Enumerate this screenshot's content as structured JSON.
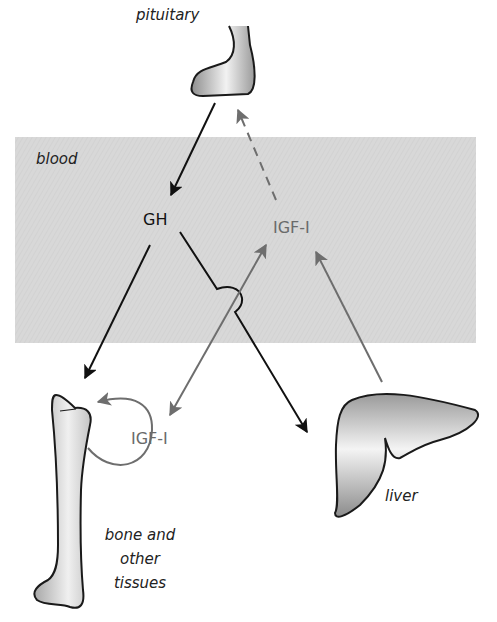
{
  "colors": {
    "blood_region": "#d6d6d6",
    "gh_arrow": "#111111",
    "igf_arrow": "#6e6e6e",
    "organ_outline": "#1a1a1a",
    "organ_fill_dark": "#9a9a9a",
    "organ_fill_light": "#f4f4f4",
    "igf_text": "#6a6a6a",
    "gh_text": "#111111"
  },
  "labels": {
    "pituitary": "pituitary",
    "blood": "blood",
    "gh": "GH",
    "igf_blood": "IGF-I",
    "igf_local": "IGF-I",
    "liver": "liver",
    "bone_line1": "bone and",
    "bone_line2": "other",
    "bone_line3": "tissues"
  },
  "nodes": [
    {
      "id": "pituitary",
      "label": "pituitary",
      "type": "organ"
    },
    {
      "id": "gh",
      "label": "GH",
      "type": "hormone",
      "region": "blood"
    },
    {
      "id": "igf_blood",
      "label": "IGF-I",
      "type": "hormone",
      "region": "blood"
    },
    {
      "id": "liver",
      "label": "liver",
      "type": "organ"
    },
    {
      "id": "bone",
      "label": "bone and other tissues",
      "type": "organ"
    },
    {
      "id": "igf_local",
      "label": "IGF-I",
      "type": "hormone",
      "region": "tissue"
    }
  ],
  "edges": [
    {
      "from": "pituitary",
      "to": "gh",
      "style": "solid",
      "color": "black"
    },
    {
      "from": "gh",
      "to": "bone",
      "style": "solid",
      "color": "black"
    },
    {
      "from": "gh",
      "to": "liver",
      "style": "solid",
      "color": "black",
      "note": "hops over IGF-I line"
    },
    {
      "from": "liver",
      "to": "igf_blood",
      "style": "solid",
      "color": "gray"
    },
    {
      "from": "igf_blood",
      "to": "pituitary",
      "style": "dashed",
      "color": "gray",
      "note": "feedback"
    },
    {
      "from": "igf_local",
      "to": "igf_blood",
      "style": "solid",
      "color": "gray",
      "bidirectional": true
    },
    {
      "from": "igf_local",
      "to": "bone",
      "style": "curved",
      "color": "gray",
      "note": "autocrine/paracrine loop"
    }
  ]
}
